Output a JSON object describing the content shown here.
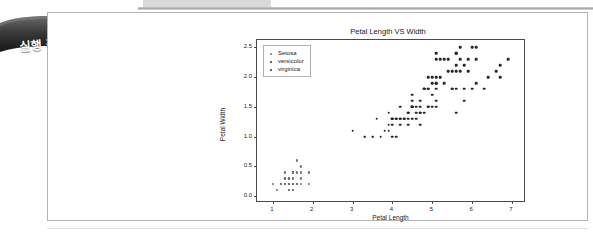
{
  "banner": {
    "label": "실행 결과"
  },
  "chart_data": {
    "type": "scatter",
    "title": "Petal Length VS Width",
    "xlabel": "Petal Length",
    "ylabel": "Petal Width",
    "xlim": [
      0.6,
      7.3
    ],
    "ylim": [
      -0.08,
      2.62
    ],
    "xticks": [
      "1",
      "2",
      "3",
      "4",
      "5",
      "6",
      "7"
    ],
    "xtick_values": [
      1,
      2,
      3,
      4,
      5,
      6,
      7
    ],
    "yticks": [
      "0.0",
      "0.5",
      "1.0",
      "1.5",
      "2.0",
      "2.5"
    ],
    "ytick_values": [
      0.0,
      0.5,
      1.0,
      1.5,
      2.0,
      2.5
    ],
    "grid": false,
    "legend_position": "upper left",
    "series": [
      {
        "name": "Setosa",
        "color": "#6e6e6e",
        "points": [
          [
            1.4,
            0.2
          ],
          [
            1.4,
            0.2
          ],
          [
            1.3,
            0.2
          ],
          [
            1.5,
            0.2
          ],
          [
            1.4,
            0.2
          ],
          [
            1.7,
            0.4
          ],
          [
            1.4,
            0.3
          ],
          [
            1.5,
            0.2
          ],
          [
            1.4,
            0.2
          ],
          [
            1.5,
            0.1
          ],
          [
            1.5,
            0.2
          ],
          [
            1.6,
            0.2
          ],
          [
            1.4,
            0.1
          ],
          [
            1.1,
            0.1
          ],
          [
            1.2,
            0.2
          ],
          [
            1.5,
            0.4
          ],
          [
            1.3,
            0.4
          ],
          [
            1.4,
            0.3
          ],
          [
            1.7,
            0.3
          ],
          [
            1.5,
            0.3
          ],
          [
            1.7,
            0.2
          ],
          [
            1.5,
            0.4
          ],
          [
            1.0,
            0.2
          ],
          [
            1.7,
            0.5
          ],
          [
            1.9,
            0.2
          ],
          [
            1.6,
            0.2
          ],
          [
            1.6,
            0.4
          ],
          [
            1.5,
            0.2
          ],
          [
            1.4,
            0.2
          ],
          [
            1.6,
            0.2
          ],
          [
            1.6,
            0.2
          ],
          [
            1.5,
            0.4
          ],
          [
            1.5,
            0.1
          ],
          [
            1.4,
            0.2
          ],
          [
            1.5,
            0.2
          ],
          [
            1.2,
            0.2
          ],
          [
            1.3,
            0.2
          ],
          [
            1.4,
            0.1
          ],
          [
            1.3,
            0.2
          ],
          [
            1.5,
            0.2
          ],
          [
            1.3,
            0.3
          ],
          [
            1.3,
            0.3
          ],
          [
            1.3,
            0.2
          ],
          [
            1.6,
            0.6
          ],
          [
            1.9,
            0.4
          ],
          [
            1.4,
            0.3
          ],
          [
            1.6,
            0.2
          ],
          [
            1.4,
            0.2
          ],
          [
            1.5,
            0.2
          ],
          [
            1.4,
            0.2
          ]
        ]
      },
      {
        "name": "versicolor",
        "color": "#262626",
        "points": [
          [
            4.7,
            1.4
          ],
          [
            4.5,
            1.5
          ],
          [
            4.9,
            1.5
          ],
          [
            4.0,
            1.3
          ],
          [
            4.6,
            1.5
          ],
          [
            4.5,
            1.3
          ],
          [
            4.7,
            1.6
          ],
          [
            3.3,
            1.0
          ],
          [
            4.6,
            1.3
          ],
          [
            3.9,
            1.4
          ],
          [
            3.5,
            1.0
          ],
          [
            4.2,
            1.5
          ],
          [
            4.0,
            1.0
          ],
          [
            4.7,
            1.4
          ],
          [
            3.6,
            1.3
          ],
          [
            4.4,
            1.4
          ],
          [
            4.5,
            1.5
          ],
          [
            4.1,
            1.0
          ],
          [
            4.5,
            1.5
          ],
          [
            3.9,
            1.1
          ],
          [
            4.8,
            1.8
          ],
          [
            4.0,
            1.3
          ],
          [
            4.9,
            1.5
          ],
          [
            4.7,
            1.2
          ],
          [
            4.3,
            1.3
          ],
          [
            4.4,
            1.4
          ],
          [
            4.8,
            1.4
          ],
          [
            5.0,
            1.7
          ],
          [
            4.5,
            1.5
          ],
          [
            3.5,
            1.0
          ],
          [
            3.8,
            1.1
          ],
          [
            3.7,
            1.0
          ],
          [
            3.9,
            1.2
          ],
          [
            5.1,
            1.6
          ],
          [
            4.5,
            1.5
          ],
          [
            4.5,
            1.6
          ],
          [
            4.7,
            1.5
          ],
          [
            4.4,
            1.3
          ],
          [
            4.1,
            1.3
          ],
          [
            4.0,
            1.3
          ],
          [
            4.4,
            1.2
          ],
          [
            4.6,
            1.4
          ],
          [
            4.0,
            1.2
          ],
          [
            3.3,
            1.0
          ],
          [
            4.2,
            1.3
          ],
          [
            4.2,
            1.2
          ],
          [
            4.2,
            1.3
          ],
          [
            4.3,
            1.3
          ],
          [
            3.0,
            1.1
          ],
          [
            4.1,
            1.3
          ]
        ]
      },
      {
        "name": "virginica",
        "color": "#262626",
        "points": [
          [
            6.0,
            2.5
          ],
          [
            5.1,
            1.9
          ],
          [
            5.9,
            2.1
          ],
          [
            5.6,
            1.8
          ],
          [
            5.8,
            2.2
          ],
          [
            6.6,
            2.1
          ],
          [
            4.5,
            1.7
          ],
          [
            6.3,
            1.8
          ],
          [
            5.8,
            1.8
          ],
          [
            6.1,
            2.5
          ],
          [
            5.1,
            2.0
          ],
          [
            5.3,
            1.9
          ],
          [
            5.5,
            2.1
          ],
          [
            5.0,
            2.0
          ],
          [
            5.1,
            2.4
          ],
          [
            5.3,
            2.3
          ],
          [
            5.5,
            1.8
          ],
          [
            6.7,
            2.2
          ],
          [
            6.9,
            2.3
          ],
          [
            5.0,
            1.5
          ],
          [
            5.7,
            2.3
          ],
          [
            4.9,
            2.0
          ],
          [
            6.7,
            2.0
          ],
          [
            4.9,
            1.8
          ],
          [
            5.7,
            2.1
          ],
          [
            6.0,
            1.8
          ],
          [
            4.8,
            1.8
          ],
          [
            4.9,
            1.8
          ],
          [
            5.6,
            2.1
          ],
          [
            5.8,
            1.6
          ],
          [
            6.1,
            1.9
          ],
          [
            6.4,
            2.0
          ],
          [
            5.6,
            2.2
          ],
          [
            5.1,
            1.5
          ],
          [
            5.6,
            1.4
          ],
          [
            6.1,
            2.3
          ],
          [
            5.6,
            2.4
          ],
          [
            5.5,
            1.8
          ],
          [
            4.8,
            1.8
          ],
          [
            5.4,
            2.1
          ],
          [
            5.6,
            2.4
          ],
          [
            5.1,
            2.3
          ],
          [
            5.1,
            1.9
          ],
          [
            5.9,
            2.3
          ],
          [
            5.7,
            2.5
          ],
          [
            5.2,
            2.3
          ],
          [
            5.0,
            1.9
          ],
          [
            5.2,
            2.0
          ],
          [
            5.4,
            2.3
          ],
          [
            5.1,
            1.8
          ]
        ]
      }
    ]
  }
}
